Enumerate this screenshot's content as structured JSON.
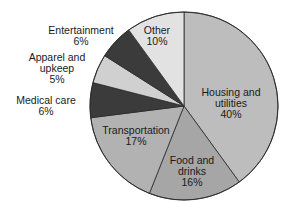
{
  "chart_data": {
    "type": "pie",
    "title": "",
    "start_angle_deg": 0,
    "direction": "clockwise",
    "center": [
      184,
      106
    ],
    "radius": 94,
    "slices": [
      {
        "label": "Housing and utilities",
        "value": 40,
        "display_value": "40%",
        "color": "#bdbdbd",
        "label_lines": [
          "Housing and",
          "utilities",
          "40%"
        ],
        "label_pos": [
          231,
          92
        ],
        "label_inside": true
      },
      {
        "label": "Food and drinks",
        "value": 16,
        "display_value": "16%",
        "color": "#a6a6a6",
        "label_lines": [
          "Food and",
          "drinks",
          "16%"
        ],
        "label_pos": [
          192,
          160
        ],
        "label_inside": true
      },
      {
        "label": "Transportation",
        "value": 17,
        "display_value": "17%",
        "color": "#b2b2b2",
        "label_lines": [
          "Transportation",
          "17%"
        ],
        "label_pos": [
          136,
          130
        ],
        "label_inside": true
      },
      {
        "label": "Medical care",
        "value": 6,
        "display_value": "6%",
        "color": "#3b3b3b",
        "label_lines": [
          "Medical care",
          "6%"
        ],
        "label_pos": [
          46,
          100
        ],
        "label_inside": false
      },
      {
        "label": "Apparel and upkeep",
        "value": 5,
        "display_value": "5%",
        "color": "#d0d0d0",
        "label_lines": [
          "Apparel and",
          "upkeep",
          "5%"
        ],
        "label_pos": [
          57,
          57
        ],
        "label_inside": false
      },
      {
        "label": "Entertainment",
        "value": 6,
        "display_value": "6%",
        "color": "#3b3b3b",
        "label_lines": [
          "Entertainment",
          "6%"
        ],
        "label_pos": [
          81,
          30
        ],
        "label_inside": false
      },
      {
        "label": "Other",
        "value": 10,
        "display_value": "10%",
        "color": "#e2e2e2",
        "label_lines": [
          "Other",
          "10%"
        ],
        "label_pos": [
          157,
          30
        ],
        "label_inside": true
      }
    ],
    "categories": [
      "Housing and utilities",
      "Food and drinks",
      "Transportation",
      "Medical care",
      "Apparel and upkeep",
      "Entertainment",
      "Other"
    ],
    "values": [
      40,
      16,
      17,
      6,
      5,
      6,
      10
    ],
    "units": "%",
    "legend": "none (direct labels)",
    "line_height": 11
  }
}
